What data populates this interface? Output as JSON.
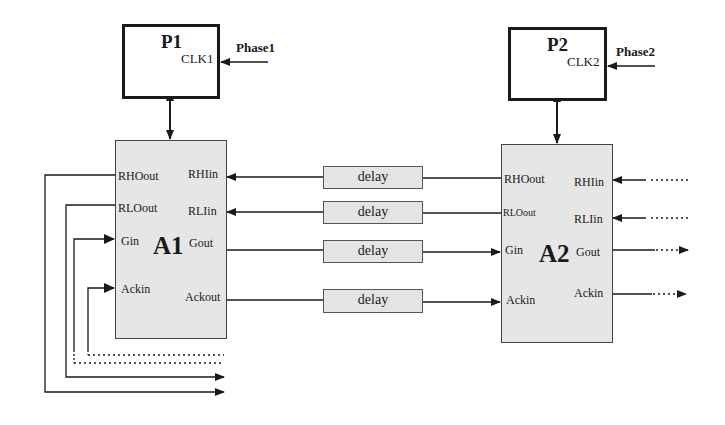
{
  "processors": [
    {
      "id": "P1",
      "label": "P1",
      "clock_label": "CLK1",
      "phase_label": "Phase1"
    },
    {
      "id": "P2",
      "label": "P2",
      "clock_label": "CLK2",
      "phase_label": "Phase2"
    }
  ],
  "arbiters": [
    {
      "id": "A1",
      "label": "A1",
      "left_ports": [
        "RHOout",
        "RLOout",
        "Gin",
        "Ackin"
      ],
      "right_ports": [
        "RHIin",
        "RLIin",
        "Gout",
        "Ackout"
      ]
    },
    {
      "id": "A2",
      "label": "A2",
      "left_ports": [
        "RHOout",
        "RLOout",
        "Gin",
        "Ackin"
      ],
      "right_ports": [
        "RHIin",
        "RLIin",
        "Gout",
        "Ackin"
      ]
    }
  ],
  "delays": [
    {
      "label": "delay"
    },
    {
      "label": "delay"
    },
    {
      "label": "delay"
    },
    {
      "label": "delay"
    }
  ],
  "colors": {
    "line": "#1a1a1a",
    "arbiter_fill": "#e6e6e6",
    "delay_fill": "#e4e4e4"
  }
}
